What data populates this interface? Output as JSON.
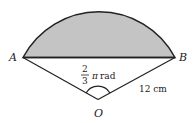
{
  "diagram": {
    "type": "circle-sector-segment",
    "points": {
      "A": "A",
      "B": "B",
      "O": "O"
    },
    "angle_label": {
      "numerator": "2",
      "denominator": "3",
      "symbol": "π",
      "unit": "rad"
    },
    "radius_label": "12 cm",
    "colors": {
      "segment_fill": "#c4c4c4",
      "stroke": "#222222",
      "background": "#ffffff"
    }
  }
}
